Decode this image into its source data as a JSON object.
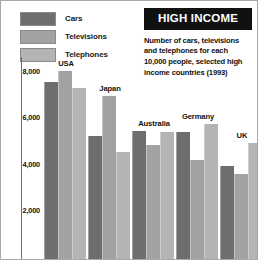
{
  "title": "HIGH INCOME",
  "subtitle": "Number of cars, televisions and telephones for each 10,000 people, selected high income countries (1993)",
  "legend": {
    "items": [
      {
        "label": "Cars",
        "color": "#6e6e6e"
      },
      {
        "label": "Televisions",
        "color": "#a2a2a2"
      },
      {
        "label": "Telephones",
        "color": "#b4b4b4"
      }
    ]
  },
  "axis": {
    "ticks": [
      {
        "label": "8,000",
        "value": 8000
      },
      {
        "label": "6,000",
        "value": 6000
      },
      {
        "label": "4,000",
        "value": 4000
      },
      {
        "label": "2,000",
        "value": 2000
      }
    ]
  },
  "chart_data": {
    "type": "bar",
    "title": "HIGH INCOME",
    "subtitle": "Number of cars, televisions and telephones for each 10,000 people, selected high income countries (1993)",
    "categories": [
      "USA",
      "Japan",
      "Australia",
      "Germany",
      "UK"
    ],
    "series": [
      {
        "name": "Cars",
        "color": "#6e6e6e",
        "values": [
          7600,
          5300,
          5500,
          5450,
          4000
        ]
      },
      {
        "name": "Televisions",
        "color": "#a2a2a2",
        "values": [
          8100,
          7000,
          4900,
          4250,
          3650
        ]
      },
      {
        "name": "Telephones",
        "color": "#b4b4b4",
        "values": [
          7350,
          4600,
          5450,
          5800,
          5000
        ]
      }
    ],
    "xlabel": "",
    "ylabel": "",
    "ylim": [
      0,
      8600
    ],
    "ytick_values": [
      2000,
      4000,
      6000,
      8000
    ],
    "ytick_labels": [
      "2,000",
      "4,000",
      "6,000",
      "8,000"
    ],
    "grid": false,
    "legend_position": "top-left"
  }
}
